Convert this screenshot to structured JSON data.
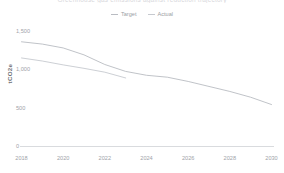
{
  "chart_data": {
    "type": "line",
    "title": "Greenhouse gas emissions against reduction trajectory",
    "xlabel": "",
    "ylabel": "tCO2e",
    "xlim": [
      2018,
      2030
    ],
    "ylim": [
      0,
      1500
    ],
    "grid": false,
    "legend_position": "top-center",
    "x_ticks": [
      "2018",
      "2020",
      "2022",
      "2024",
      "2026",
      "2028",
      "2030"
    ],
    "x_tick_values": [
      2018,
      2020,
      2022,
      2024,
      2026,
      2028,
      2030
    ],
    "y_ticks": [
      "0",
      "500",
      "1,000",
      "1,500"
    ],
    "y_tick_values": [
      0,
      500,
      1000,
      1500
    ],
    "series": [
      {
        "name": "Target",
        "color": "#b9bcc2",
        "x": [
          2018,
          2019,
          2020,
          2021,
          2022,
          2023,
          2024,
          2025,
          2026,
          2027,
          2028,
          2029,
          2030
        ],
        "values": [
          1360,
          1330,
          1280,
          1190,
          1065,
          975,
          925,
          900,
          845,
          780,
          715,
          640,
          545
        ]
      },
      {
        "name": "Actual",
        "color": "#c6c9cf",
        "x": [
          2018,
          2019,
          2020,
          2021,
          2022,
          2023
        ],
        "values": [
          1150,
          1110,
          1060,
          1015,
          965,
          890
        ]
      }
    ]
  },
  "legend": {
    "items": [
      {
        "label": "Target"
      },
      {
        "label": "Actual"
      }
    ]
  },
  "axes": {
    "y_title": "tCO2e"
  },
  "colors": {
    "target": "#b9bcc2",
    "actual": "#c6c9cf",
    "axis": "#d5d7da",
    "tick_text": "#a0a3a9",
    "background": "#ffffff"
  }
}
